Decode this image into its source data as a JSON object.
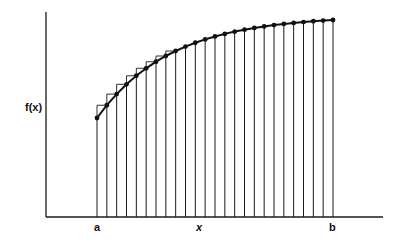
{
  "diagram": {
    "type": "riemann-sum-illustration",
    "labels": {
      "y_axis": "f(x)",
      "x_axis": "x",
      "left_bound": "a",
      "right_bound": "b"
    },
    "colors": {
      "stroke": "#1a1a1a",
      "background": "#ffffff"
    },
    "curve": {
      "description": "increasing concave curve approaching an asymptote",
      "num_points": 25,
      "marker": "filled-dot",
      "upper_rectangle_marker": "square"
    },
    "partition": {
      "num_lines": 25,
      "num_intervals": 24
    }
  }
}
